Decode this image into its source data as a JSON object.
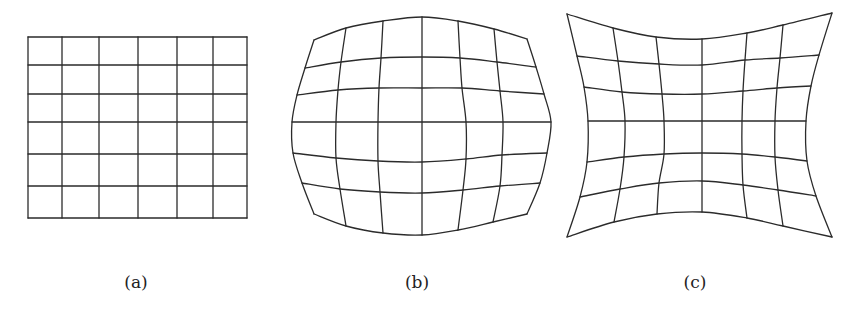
{
  "figure": {
    "panels": [
      {
        "id": "a",
        "label": "(a)",
        "label_x": 136,
        "distortion": "none",
        "rows": [
          [
            [
              28,
              37
            ],
            [
              62,
              37
            ],
            [
              99,
              37
            ],
            [
              138,
              37
            ],
            [
              177,
              37
            ],
            [
              213,
              37
            ],
            [
              247,
              37
            ]
          ],
          [
            [
              28,
              65
            ],
            [
              62,
              65
            ],
            [
              99,
              65
            ],
            [
              138,
              65
            ],
            [
              177,
              65
            ],
            [
              213,
              65
            ],
            [
              247,
              65
            ]
          ],
          [
            [
              28,
              94
            ],
            [
              62,
              94
            ],
            [
              99,
              94
            ],
            [
              138,
              94
            ],
            [
              177,
              94
            ],
            [
              213,
              94
            ],
            [
              247,
              94
            ]
          ],
          [
            [
              28,
              122
            ],
            [
              62,
              122
            ],
            [
              99,
              122
            ],
            [
              138,
              122
            ],
            [
              177,
              122
            ],
            [
              213,
              122
            ],
            [
              247,
              122
            ]
          ],
          [
            [
              28,
              154
            ],
            [
              62,
              154
            ],
            [
              99,
              154
            ],
            [
              138,
              154
            ],
            [
              177,
              154
            ],
            [
              213,
              154
            ],
            [
              247,
              154
            ]
          ],
          [
            [
              28,
              186
            ],
            [
              62,
              186
            ],
            [
              99,
              186
            ],
            [
              138,
              186
            ],
            [
              177,
              186
            ],
            [
              213,
              186
            ],
            [
              247,
              186
            ]
          ],
          [
            [
              28,
              218
            ],
            [
              62,
              218
            ],
            [
              99,
              218
            ],
            [
              138,
              218
            ],
            [
              177,
              218
            ],
            [
              213,
              218
            ],
            [
              247,
              218
            ]
          ]
        ]
      },
      {
        "id": "b",
        "label": "(b)",
        "label_x": 417,
        "distortion": "barrel",
        "rows": [
          [
            [
              314,
              40
            ],
            [
              346,
              28
            ],
            [
              383,
              21
            ],
            [
              422,
              17
            ],
            [
              458,
              21
            ],
            [
              494,
              29
            ],
            [
              527,
              39
            ]
          ],
          [
            [
              305,
              68
            ],
            [
              341,
              62
            ],
            [
              381,
              58
            ],
            [
              422,
              57
            ],
            [
              460,
              58
            ],
            [
              497,
              62
            ],
            [
              536,
              67
            ]
          ],
          [
            [
              297,
              95
            ],
            [
              338,
              90
            ],
            [
              379,
              88
            ],
            [
              422,
              88
            ],
            [
              462,
              88
            ],
            [
              500,
              91
            ],
            [
              544,
              94
            ]
          ],
          [
            [
              292,
              122
            ],
            [
              336,
              122
            ],
            [
              378,
              122
            ],
            [
              422,
              122
            ],
            [
              466,
              122
            ],
            [
              503,
              122
            ],
            [
              551,
              122
            ]
          ],
          [
            [
              293,
              153
            ],
            [
              336,
              158
            ],
            [
              378,
              161
            ],
            [
              422,
              162
            ],
            [
              466,
              159
            ],
            [
              502,
              155
            ],
            [
              547,
              153
            ]
          ],
          [
            [
              302,
              183
            ],
            [
              340,
              189
            ],
            [
              380,
              192
            ],
            [
              422,
              193
            ],
            [
              463,
              190
            ],
            [
              500,
              186
            ],
            [
              540,
              183
            ]
          ],
          [
            [
              314,
              214
            ],
            [
              346,
              226
            ],
            [
              383,
              233
            ],
            [
              422,
              235
            ],
            [
              458,
              230
            ],
            [
              493,
              222
            ],
            [
              527,
              214
            ]
          ]
        ]
      },
      {
        "id": "c",
        "label": "(c)",
        "label_x": 695,
        "distortion": "pincushion",
        "rows": [
          [
            [
              567,
              14
            ],
            [
              613,
              28
            ],
            [
              656,
              37
            ],
            [
              702,
              39
            ],
            [
              747,
              33
            ],
            [
              783,
              25
            ],
            [
              832,
              13
            ]
          ],
          [
            [
              577,
              56
            ],
            [
              618,
              61
            ],
            [
              659,
              64
            ],
            [
              702,
              65
            ],
            [
              745,
              60
            ],
            [
              780,
              58
            ],
            [
              819,
              55
            ]
          ],
          [
            [
              584,
              87
            ],
            [
              622,
              92
            ],
            [
              662,
              94
            ],
            [
              702,
              94
            ],
            [
              743,
              91
            ],
            [
              777,
              88
            ],
            [
              811,
              86
            ]
          ],
          [
            [
              588,
              121
            ],
            [
              625,
              121
            ],
            [
              664,
              121
            ],
            [
              702,
              121
            ],
            [
              742,
              121
            ],
            [
              775,
              121
            ],
            [
              806,
              121
            ]
          ],
          [
            [
              587,
              162
            ],
            [
              624,
              157
            ],
            [
              664,
              154
            ],
            [
              702,
              153
            ],
            [
              742,
              154
            ],
            [
              775,
              157
            ],
            [
              807,
              161
            ]
          ],
          [
            [
              580,
              197
            ],
            [
              620,
              189
            ],
            [
              659,
              183
            ],
            [
              702,
              181
            ],
            [
              743,
              185
            ],
            [
              778,
              190
            ],
            [
              816,
              196
            ]
          ],
          [
            [
              567,
              237
            ],
            [
              614,
              222
            ],
            [
              657,
              214
            ],
            [
              702,
              212
            ],
            [
              747,
              218
            ],
            [
              783,
              226
            ],
            [
              832,
              237
            ]
          ]
        ]
      }
    ],
    "colors": {
      "line": "#2b2b2b",
      "background": "#ffffff",
      "label": "#222222"
    }
  }
}
